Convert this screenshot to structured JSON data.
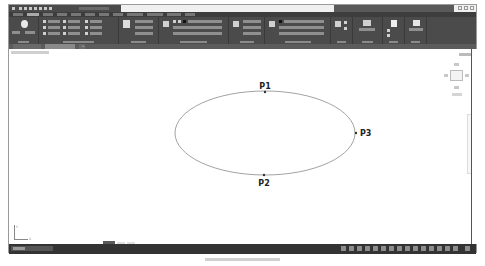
{
  "window": {
    "title": "",
    "search_placeholder": ""
  },
  "ribbon": {
    "tabs": [
      "",
      "",
      "",
      "",
      "",
      "",
      "",
      "",
      "",
      "",
      "",
      ""
    ],
    "panels": [
      {
        "caption": ""
      },
      {
        "caption": ""
      },
      {
        "caption": ""
      },
      {
        "caption": ""
      },
      {
        "caption": ""
      },
      {
        "caption": ""
      },
      {
        "caption": ""
      },
      {
        "caption": ""
      },
      {
        "caption": ""
      },
      {
        "caption": ""
      }
    ]
  },
  "document_tabs": {
    "start": "",
    "file": "",
    "add": "+"
  },
  "viewport": {
    "label": "",
    "viewcube": {
      "top": "",
      "north": "",
      "south": "",
      "east": "",
      "west": "",
      "wcs": ""
    },
    "ucs": {
      "x": "X",
      "y": "Y"
    }
  },
  "drawing": {
    "ellipse": {
      "cx": 265,
      "cy": 133,
      "rx": 90,
      "ry": 42,
      "stroke": "#8a8a8a"
    },
    "points": [
      {
        "label": "P1",
        "x": 265,
        "y": 92,
        "label_x": 265,
        "label_y": 89,
        "anchor": "middle"
      },
      {
        "label": "P2",
        "x": 264,
        "y": 175,
        "label_x": 264,
        "label_y": 186,
        "anchor": "middle"
      },
      {
        "label": "P3",
        "x": 356,
        "y": 133,
        "label_x": 360,
        "label_y": 136,
        "anchor": "start"
      }
    ]
  },
  "layout_tabs": {
    "model": "",
    "layout1": "",
    "layout2": ""
  },
  "statusbar": {
    "command_prompt": "",
    "mode_buttons": [
      "",
      "",
      "",
      "",
      "",
      "",
      "",
      "",
      "",
      "",
      "",
      "",
      "",
      "",
      "",
      ""
    ]
  },
  "caption": ""
}
